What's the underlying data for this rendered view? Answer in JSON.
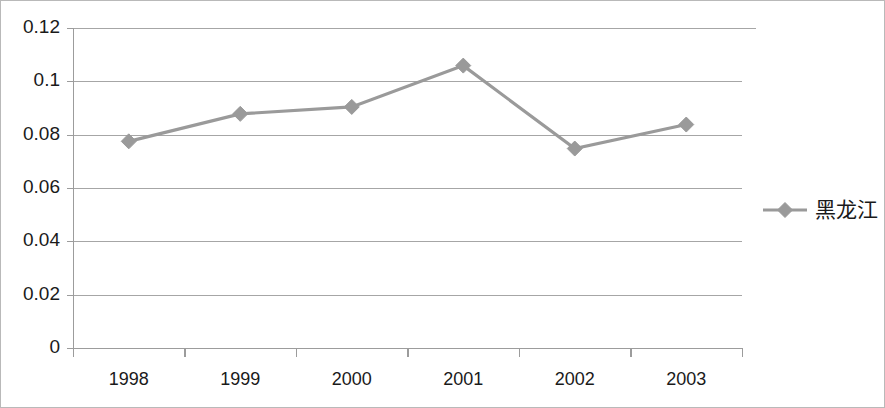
{
  "chart_data": {
    "type": "line",
    "title": "",
    "subtitle": "",
    "xlabel": "",
    "ylabel": "",
    "categories": [
      "1998",
      "1999",
      "2000",
      "2001",
      "2002",
      "2003"
    ],
    "series": [
      {
        "name": "黑龙江",
        "values": [
          0.0775,
          0.0878,
          0.0904,
          0.1059,
          0.0748,
          0.0838
        ],
        "color": "#9a9a9a",
        "marker": "diamond"
      }
    ],
    "ylim": [
      0,
      0.12
    ],
    "ytick_labels": [
      "0",
      "0.02",
      "0.04",
      "0.06",
      "0.08",
      "0.1",
      "0.12"
    ],
    "ytick_values": [
      0,
      0.02,
      0.04,
      0.06,
      0.08,
      0.1,
      0.12
    ],
    "xtick_labels": [
      "1998",
      "1999",
      "2000",
      "2001",
      "2002",
      "2003"
    ],
    "grid": "horizontal",
    "legend_position": "right",
    "legend_entries": [
      {
        "label": "黑龙江",
        "color": "#9a9a9a",
        "marker": "diamond"
      }
    ],
    "plot_background": "#ffffff",
    "gridline_color": "#a6a6a6",
    "border_color": "#b9b9b9"
  }
}
